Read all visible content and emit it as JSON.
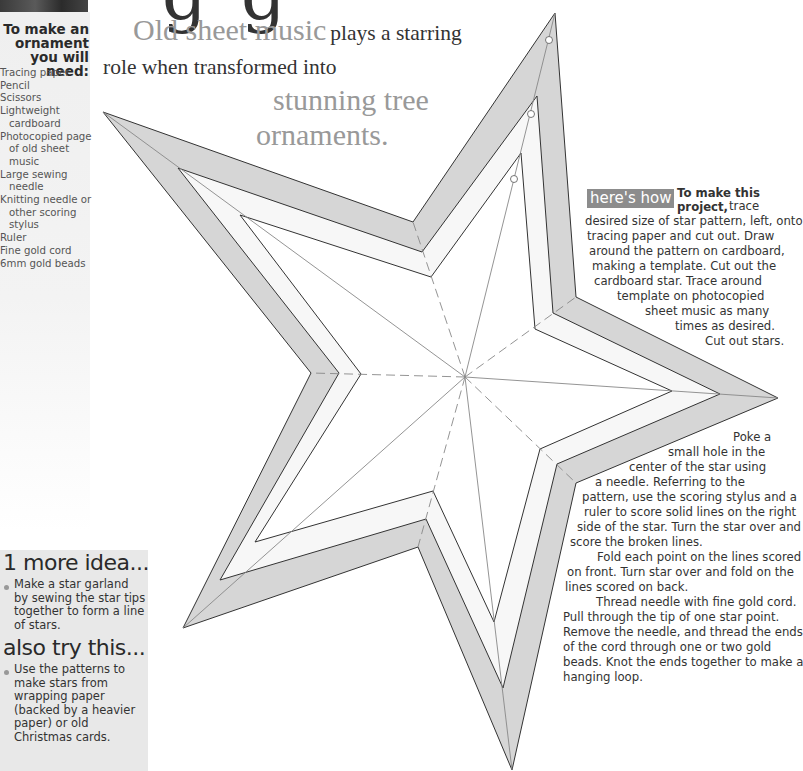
{
  "header": {
    "heading_fragment": "g g",
    "deck": {
      "line1_accent": "Old sheet music",
      "line1_plain": "plays a starring",
      "line2_plain": "role when transformed into",
      "line3_accent": "stunning tree",
      "line4_accent": "ornaments."
    }
  },
  "sidebar": {
    "title": "To make an ornament you will need:",
    "items": [
      "Tracing paper",
      "Pencil",
      "Scissors",
      "Lightweight cardboard",
      "Photocopied page of old sheet music",
      "Large sewing needle",
      "Knitting needle or other scoring stylus",
      "Ruler",
      "Fine gold cord",
      "6mm gold beads"
    ]
  },
  "instructions": {
    "badge": "here's how",
    "lead_bold": "To make this project,",
    "step1_lines": [
      "trace",
      "desired size of star pattern, left, onto",
      "tracing paper and cut out. Draw",
      "around the pattern on cardboard,",
      "making a template. Cut out the",
      "cardboard star. Trace around",
      "template on photocopied",
      "sheet music as many",
      "times as desired.",
      "Cut out stars."
    ],
    "step2_lines": [
      "Poke a",
      "small hole in the",
      "center of the star using",
      "a needle. Referring to the",
      "pattern, use the scoring stylus and a",
      "ruler to score solid lines on the right",
      "side of the star. Turn the star over and",
      "score the broken lines.",
      "Fold each point on the lines scored",
      "on front. Turn star over and fold on the",
      "lines scored on back.",
      "Thread needle with fine gold cord.",
      "Pull through the tip of one star point.",
      "Remove the needle, and thread the ends",
      "of the cord through one or two gold",
      "beads. Knot the ends together to make a",
      "hanging loop."
    ]
  },
  "ideas": {
    "more_idea_title": "1 more idea...",
    "more_idea_text": "Make a star garland by sewing the star tips together to form a line of stars.",
    "also_try_title": "also try this...",
    "also_try_text": "Use the patterns to make stars from wrapping paper (backed by a heavier paper) or old Christmas cards."
  },
  "star_pattern": {
    "center": [
      465,
      377
    ],
    "colors": {
      "outer_band": "#d6d6d6",
      "middle_band": "#f7f7f7",
      "inner": "#ffffff",
      "stroke": "#333333",
      "score_line": "#888888"
    },
    "outer": [
      [
        555,
        13
      ],
      [
        576,
        297
      ],
      [
        778,
        398
      ],
      [
        576,
        483
      ],
      [
        512,
        770
      ],
      [
        418,
        547
      ],
      [
        183,
        628
      ],
      [
        311,
        373
      ],
      [
        103,
        112
      ],
      [
        413,
        222
      ]
    ],
    "middle": [
      [
        537,
        96
      ],
      [
        553,
        313
      ],
      [
        720,
        394
      ],
      [
        557,
        464
      ],
      [
        503,
        688
      ],
      [
        426,
        519
      ],
      [
        220,
        580
      ],
      [
        339,
        373
      ],
      [
        178,
        168
      ],
      [
        422,
        252
      ]
    ],
    "inner": [
      [
        521,
        153
      ],
      [
        535,
        329
      ],
      [
        672,
        391
      ],
      [
        540,
        449
      ],
      [
        494,
        622
      ],
      [
        433,
        491
      ],
      [
        255,
        542
      ],
      [
        361,
        374
      ],
      [
        240,
        215
      ],
      [
        431,
        277
      ]
    ],
    "hole_points": [
      [
        549,
        40
      ],
      [
        531,
        114
      ],
      [
        514,
        179
      ]
    ]
  }
}
